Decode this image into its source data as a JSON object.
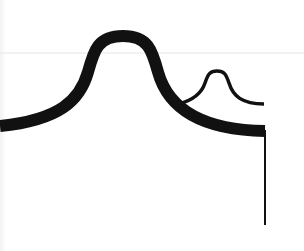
{
  "diagram": {
    "background": "#ffffff",
    "stroke_color": "#111111",
    "guide_line_color": "#e6e6e6",
    "guide_line_y": 53,
    "large_curve": {
      "label": "large bell curve",
      "stroke_width": 12,
      "path": "M 0 126 C 60 120, 80 100, 88 72 C 94 50, 98 36, 123 36 C 148 36, 152 50, 158 72 C 168 108, 200 130, 265 131"
    },
    "small_curve": {
      "label": "small bell curve",
      "stroke_width": 3.5,
      "path": "M 178 104 C 195 100, 202 92, 205 83 C 208 74, 210 71, 217 71 C 224 71, 226 74, 229 83 C 233 96, 242 104, 264 104"
    },
    "vertical_line": {
      "label": "drop line",
      "x": 265,
      "y_start": 130,
      "y_end": 225,
      "stroke_width": 2
    }
  }
}
